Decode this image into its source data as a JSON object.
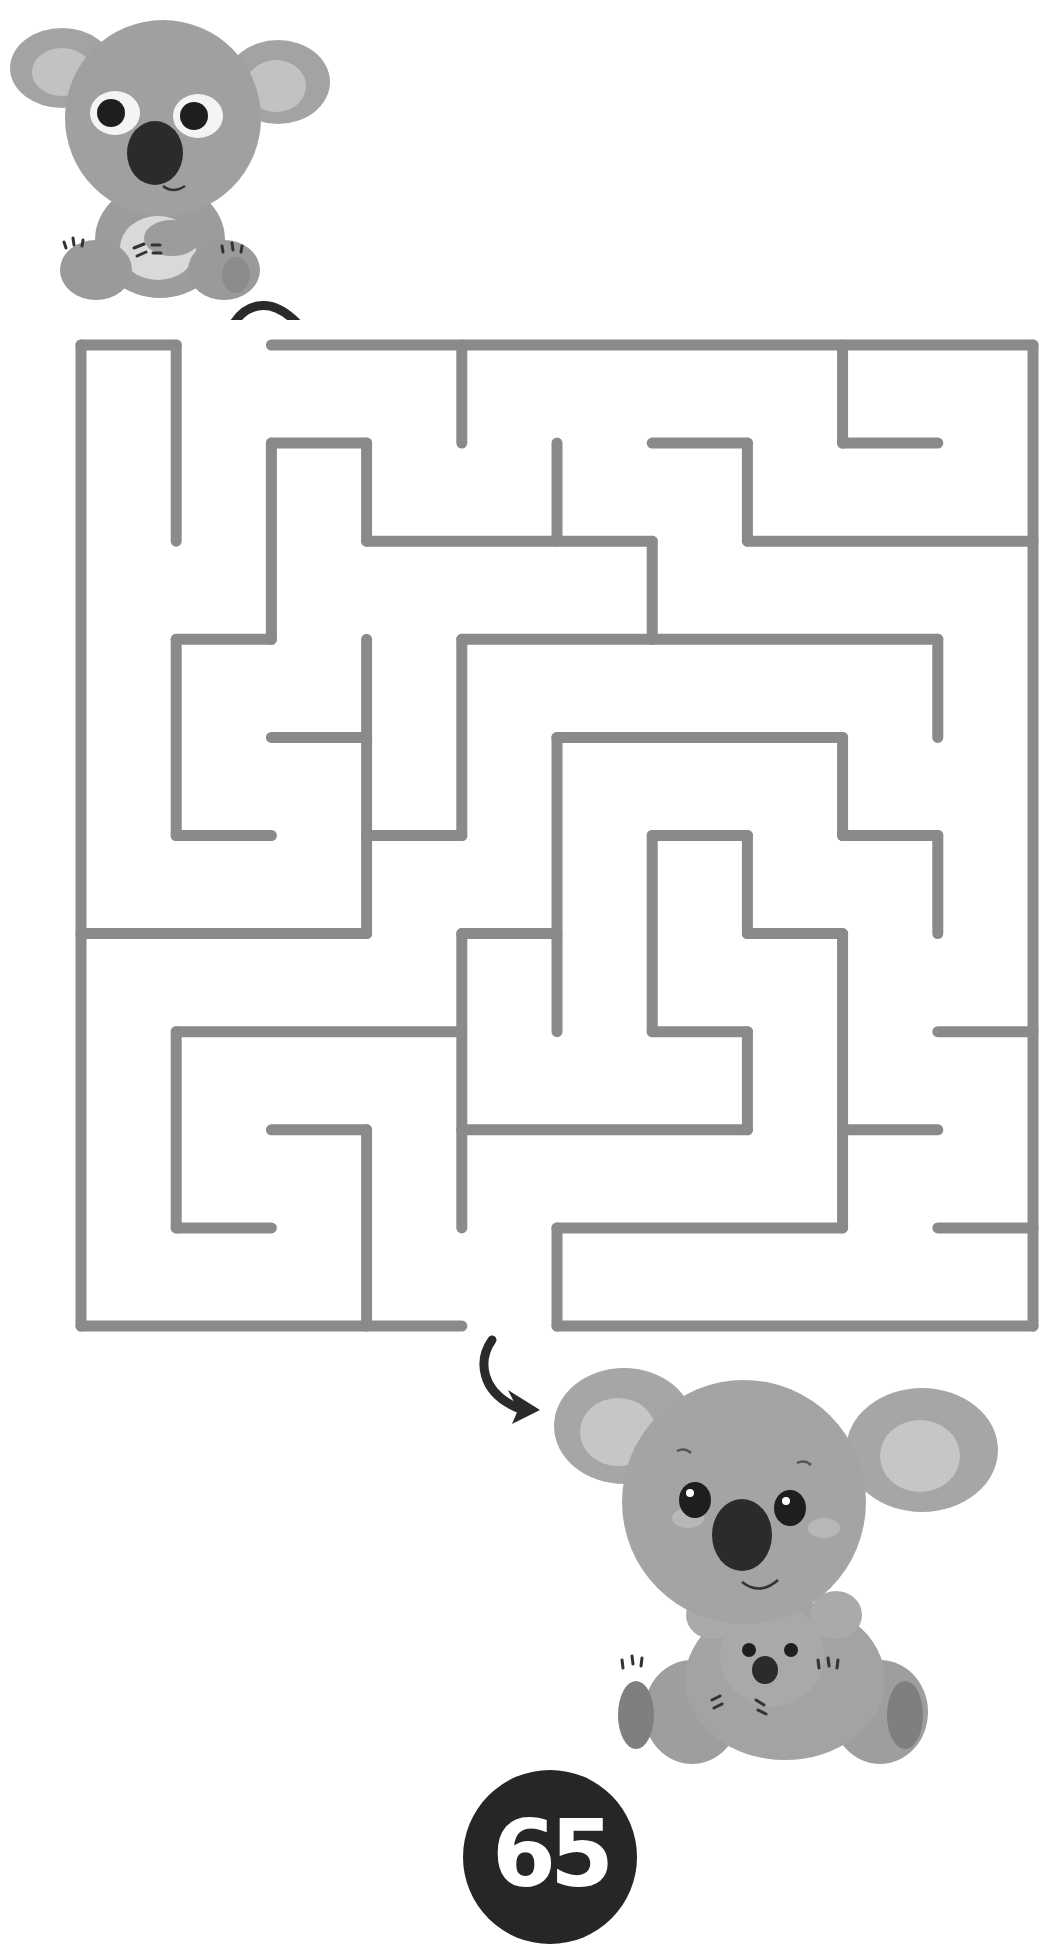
{
  "page": {
    "page_number": "65",
    "background": "#ffffff"
  },
  "maze": {
    "title": "Koala maze",
    "instructions_visible": false,
    "cols": 10,
    "rows": 10,
    "origin_px": [
      81,
      345
    ],
    "cell_px": [
      95.2,
      98.1
    ],
    "wall_color": "#8a8a8a",
    "wall_width": 11,
    "entrance": {
      "side": "top",
      "cell": [
        1,
        0
      ]
    },
    "exit": {
      "side": "bottom",
      "cell": [
        4,
        9
      ]
    },
    "walls": [
      [
        0,
        0,
        1,
        0
      ],
      [
        2,
        0,
        10,
        0
      ],
      [
        0,
        0,
        0,
        10
      ],
      [
        10,
        0,
        10,
        10
      ],
      [
        0,
        10,
        4,
        10
      ],
      [
        5,
        10,
        10,
        10
      ],
      [
        1,
        0,
        1,
        2
      ],
      [
        4,
        0,
        4,
        1
      ],
      [
        8,
        0,
        8,
        1
      ],
      [
        8,
        1,
        9,
        1
      ],
      [
        2,
        1,
        3,
        1
      ],
      [
        2,
        1,
        2,
        3
      ],
      [
        1,
        3,
        2,
        3
      ],
      [
        1,
        3,
        1,
        5
      ],
      [
        1,
        5,
        2,
        5
      ],
      [
        3,
        1,
        3,
        2
      ],
      [
        3,
        2,
        6,
        2
      ],
      [
        6,
        2,
        6,
        3
      ],
      [
        5,
        1,
        5,
        2
      ],
      [
        6,
        1,
        7,
        1
      ],
      [
        7,
        1,
        7,
        2
      ],
      [
        7,
        2,
        10,
        2
      ],
      [
        2,
        4,
        3,
        4
      ],
      [
        3,
        3,
        3,
        6
      ],
      [
        0,
        6,
        3,
        6
      ],
      [
        4,
        3,
        9,
        3
      ],
      [
        4,
        3,
        4,
        5
      ],
      [
        3,
        5,
        4,
        5
      ],
      [
        9,
        3,
        9,
        4
      ],
      [
        5,
        4,
        8,
        4
      ],
      [
        5,
        4,
        5,
        7
      ],
      [
        8,
        4,
        8,
        5
      ],
      [
        8,
        5,
        9,
        5
      ],
      [
        9,
        5,
        9,
        6
      ],
      [
        6,
        5,
        7,
        5
      ],
      [
        6,
        5,
        6,
        7
      ],
      [
        6,
        7,
        7,
        7
      ],
      [
        7,
        5,
        7,
        6
      ],
      [
        7,
        6,
        8,
        6
      ],
      [
        8,
        6,
        8,
        9
      ],
      [
        4,
        6,
        5,
        6
      ],
      [
        4,
        6,
        4,
        9
      ],
      [
        1,
        7,
        4,
        7
      ],
      [
        1,
        7,
        1,
        9
      ],
      [
        1,
        9,
        2,
        9
      ],
      [
        2,
        8,
        3,
        8
      ],
      [
        3,
        8,
        3,
        10
      ],
      [
        4,
        8,
        7,
        8
      ],
      [
        7,
        7,
        7,
        8
      ],
      [
        9,
        7,
        10,
        7
      ],
      [
        8,
        8,
        9,
        8
      ],
      [
        5,
        9,
        8,
        9
      ],
      [
        5,
        9,
        5,
        10
      ],
      [
        9,
        9,
        10,
        9
      ]
    ]
  },
  "characters": [
    {
      "name": "start-koala",
      "description": "Small koala sitting, wide eyes",
      "position": "top-left"
    },
    {
      "name": "goal-koala",
      "description": "Mother koala holding baby koala",
      "position": "bottom-right"
    }
  ],
  "arrows": [
    {
      "name": "start-arrow",
      "direction": "curving down-left into entrance"
    },
    {
      "name": "finish-arrow",
      "direction": "curving down-right toward mother koala"
    }
  ],
  "colors": {
    "koala_fur": "#9a9a9a",
    "koala_ear_inner": "#bdbdbd",
    "koala_nose": "#2b2b2b",
    "arrow": "#2a2a2a",
    "badge": "#262626",
    "badge_text": "#ffffff"
  }
}
